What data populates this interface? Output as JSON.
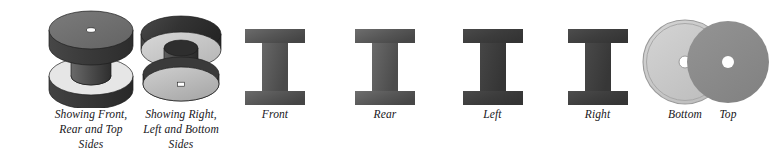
{
  "figure": {
    "background": "#ffffff",
    "caption_color": "#17161a"
  },
  "palette": {
    "disc_top_gray": "#6d6d6d",
    "disc_rim_dark": "#3a3a3a",
    "disc_under_light": "#e9e9e9",
    "cylinder_light": "#5c5c5c",
    "cylinder_dark": "#2f2f2f",
    "hole_white": "#ffffff",
    "beam_mid": "#5a5a5a",
    "beam_dark": "#3c3c3c",
    "beam_darker": "#333333",
    "circle_bottom_fill": "#c9c9c9",
    "circle_bottom_outline": "#8e8e8e",
    "circle_top_fill": "#8b8b8b",
    "outline_black": "#1c1c1c"
  },
  "panels": [
    {
      "id": "iso-front-rear-top",
      "kind": "isometric",
      "icon": "spool-isometric-top-icon",
      "caption_lines": [
        "Showing Front,",
        "Rear and Top",
        "Sides"
      ]
    },
    {
      "id": "iso-right-left-bottom",
      "kind": "isometric",
      "icon": "spool-isometric-bottom-icon",
      "caption_lines": [
        "Showing Right,",
        "Left and Bottom",
        "Sides"
      ]
    },
    {
      "id": "view-front",
      "kind": "ibeam",
      "icon": "spool-front-view-icon",
      "caption_lines": [
        "Front"
      ]
    },
    {
      "id": "view-rear",
      "kind": "ibeam",
      "icon": "spool-rear-view-icon",
      "caption_lines": [
        "Rear"
      ]
    },
    {
      "id": "view-left",
      "kind": "ibeam",
      "icon": "spool-left-view-icon",
      "caption_lines": [
        "Left"
      ]
    },
    {
      "id": "view-right",
      "kind": "ibeam",
      "icon": "spool-right-view-icon",
      "caption_lines": [
        "Right"
      ]
    },
    {
      "id": "view-bottom",
      "kind": "circle",
      "icon": "spool-bottom-view-icon",
      "caption_lines": [
        "Bottom"
      ]
    },
    {
      "id": "view-top",
      "kind": "circle",
      "icon": "spool-top-view-icon",
      "caption_lines": [
        "Top"
      ]
    }
  ]
}
